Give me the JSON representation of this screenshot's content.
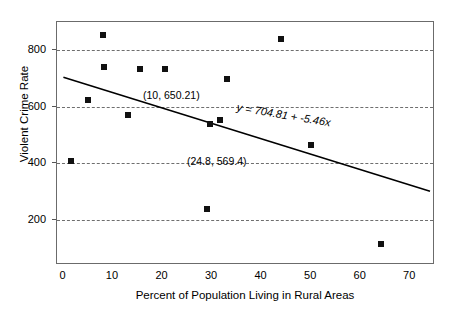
{
  "chart_data": {
    "type": "scatter",
    "title": "",
    "xlabel": "Percent of Population Living in Rural Areas",
    "ylabel": "Violent Crime Rate",
    "xlim": [
      -1.3,
      75
    ],
    "ylim": [
      40,
      900
    ],
    "xticks": [
      0,
      10,
      20,
      30,
      40,
      50,
      60,
      70
    ],
    "yticks": [
      200,
      400,
      600,
      800
    ],
    "xtick_labels": [
      "0",
      "10",
      "20",
      "30",
      "40",
      "50",
      "60",
      "70"
    ],
    "ytick_labels": [
      "200",
      "400",
      "600",
      "800"
    ],
    "grid": "horizontal-dashed",
    "legend": "none",
    "points": [
      {
        "x": 1.5,
        "y": 410
      },
      {
        "x": 5.0,
        "y": 625
      },
      {
        "x": 8.0,
        "y": 855
      },
      {
        "x": 8.2,
        "y": 740
      },
      {
        "x": 13.0,
        "y": 572
      },
      {
        "x": 15.5,
        "y": 733
      },
      {
        "x": 20.5,
        "y": 735
      },
      {
        "x": 29.0,
        "y": 237
      },
      {
        "x": 29.5,
        "y": 540
      },
      {
        "x": 31.5,
        "y": 555
      },
      {
        "x": 33.0,
        "y": 700
      },
      {
        "x": 44.0,
        "y": 840
      },
      {
        "x": 50.0,
        "y": 465
      },
      {
        "x": 64.0,
        "y": 115
      }
    ],
    "trendline": {
      "intercept": 704.81,
      "slope": -5.46,
      "equation_label": "y = 704.81 + -5.46x",
      "x_start": 0,
      "x_end": 74
    },
    "annotations": [
      {
        "text": "(10, 650.21)",
        "x": 10,
        "y": 650.21,
        "label_px": {
          "left": 142,
          "top": 89
        }
      },
      {
        "text": "(24.8, 569.4)",
        "x": 24.8,
        "y": 569.4,
        "label_px": {
          "left": 186,
          "top": 155
        }
      }
    ]
  },
  "axes": {
    "y_title": "Violent Crime Rate",
    "x_title": "Percent of Population Living in Rural Areas"
  }
}
